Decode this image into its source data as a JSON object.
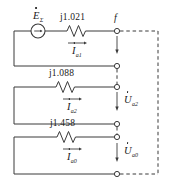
{
  "diagram": {
    "stroke_color": "#3a3a3a",
    "text_color": "#1a1a1a"
  },
  "source": {
    "symbol": "circle-with-arrow",
    "emf_letter": "E",
    "emf_subscript": "Σ"
  },
  "branches": [
    {
      "id": "positive-sequence",
      "impedance_label": "j1.021",
      "current_letter": "I",
      "current_subscript": "a1"
    },
    {
      "id": "negative-sequence",
      "impedance_label": "j1.088",
      "current_letter": "I",
      "current_subscript": "a2",
      "voltage_letter": "U",
      "voltage_subscript": "a2"
    },
    {
      "id": "zero-sequence",
      "impedance_label": "j1.458",
      "current_letter": "I",
      "current_subscript": "a0",
      "voltage_letter": "U",
      "voltage_subscript": "a0"
    }
  ],
  "nodes": {
    "fault_point": "f"
  }
}
